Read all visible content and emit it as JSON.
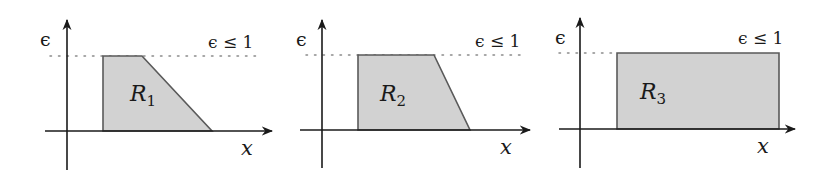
{
  "figure": {
    "panels": [
      {
        "id": "panel-1",
        "region_label": "R",
        "region_subscript": "1",
        "y_axis_label": "ϵ",
        "x_axis_label": "x",
        "constraint_label": "ϵ ≤ 1",
        "shape": "trapezoid-sloped-right",
        "geometry": {
          "y_axis_x": 67,
          "x_axis_y": 131,
          "y_axis_top": 20,
          "y_axis_bottom": 170,
          "x_axis_left": 45,
          "x_axis_right": 272,
          "dotted_y": 56,
          "dotted_left": 50,
          "dotted_right": 260,
          "polygon": "103,131 103,56 142,56 212,131",
          "region_label_x": 130,
          "region_label_y": 101,
          "constraint_x": 208,
          "constraint_y": 48,
          "eps_x": 40,
          "eps_y": 46,
          "xlabel_x": 241,
          "xlabel_y": 155
        }
      },
      {
        "id": "panel-2",
        "region_label": "R",
        "region_subscript": "2",
        "y_axis_label": "ϵ",
        "x_axis_label": "x",
        "constraint_label": "ϵ ≤ 1",
        "shape": "trapezoid-steep-right",
        "geometry": {
          "y_axis_x": 322,
          "x_axis_y": 130,
          "y_axis_top": 20,
          "y_axis_bottom": 168,
          "x_axis_left": 300,
          "x_axis_right": 530,
          "dotted_y": 55,
          "dotted_left": 306,
          "dotted_right": 522,
          "polygon": "358,130 358,55 434,55 470,130",
          "region_label_x": 380,
          "region_label_y": 101,
          "constraint_x": 475,
          "constraint_y": 47,
          "eps_x": 296,
          "eps_y": 46,
          "xlabel_x": 500,
          "xlabel_y": 154
        }
      },
      {
        "id": "panel-3",
        "region_label": "R",
        "region_subscript": "3",
        "y_axis_label": "ϵ",
        "x_axis_label": "x",
        "constraint_label": "ϵ ≤ 1",
        "shape": "rectangle",
        "geometry": {
          "y_axis_x": 580,
          "x_axis_y": 129,
          "y_axis_top": 18,
          "y_axis_bottom": 168,
          "x_axis_left": 559,
          "x_axis_right": 795,
          "dotted_y": 53,
          "dotted_left": 559,
          "dotted_right": 612,
          "polygon": "617,129 617,53 779,53 779,129",
          "region_label_x": 640,
          "region_label_y": 99,
          "constraint_x": 738,
          "constraint_y": 44,
          "eps_x": 555,
          "eps_y": 44,
          "xlabel_x": 757,
          "xlabel_y": 153
        }
      }
    ],
    "colors": {
      "region_fill": "#d2d2d2",
      "region_stroke": "#5a5a5a",
      "axis": "#1a1a1a",
      "dotted": "#8a8a8a"
    }
  }
}
